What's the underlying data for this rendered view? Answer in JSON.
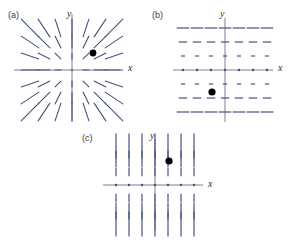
{
  "figure": {
    "width": 297,
    "height": 247,
    "background": "#ffffff",
    "colors": {
      "axis": "#6b6f86",
      "field": "#4a5080",
      "field_light": "#8d92ad",
      "marker": "#000000",
      "label": "#3a3a3a"
    }
  },
  "panels": [
    {
      "id": "a",
      "label": "(a)",
      "label_pos": {
        "x": 8,
        "y": 10
      },
      "origin": {
        "x": 72,
        "y": 70
      },
      "axis": {
        "x_min": -58,
        "x_max": 48,
        "y_min": -52,
        "y_max": 56,
        "x_label": "x",
        "y_label": "y",
        "x_label_pos": {
          "x": 128,
          "y": 62
        },
        "y_label_pos": {
          "x": 67,
          "y": 8
        }
      },
      "field": {
        "type": "radial",
        "description": "radial line segments pointing away from origin, length grows with radius",
        "grid_step": 14,
        "grid_half": 3,
        "segment_scale": 0.42,
        "segment_min": 1.5
      },
      "marker": {
        "x": 21,
        "y": 17,
        "r": 3.4,
        "color": "#000000"
      }
    },
    {
      "id": "b",
      "label": "(b)",
      "label_pos": {
        "x": 152,
        "y": 10
      },
      "origin": {
        "x": 225,
        "y": 70
      },
      "axis": {
        "x_min": -52,
        "x_max": 48,
        "y_min": -52,
        "y_max": 52,
        "x_label": "x",
        "y_label": "y",
        "x_label_pos": {
          "x": 278,
          "y": 62
        },
        "y_label_pos": {
          "x": 220,
          "y": 8
        }
      },
      "field": {
        "type": "horizontal-dashes",
        "description": "horizontal segments, length proportional to |y|, zero on the x-axis",
        "grid_step": 14,
        "grid_half": 3,
        "segment_scale": 0.3,
        "segment_min": 1.0
      },
      "marker": {
        "x": -13,
        "y": -22,
        "r": 3.6,
        "color": "#000000"
      }
    },
    {
      "id": "c",
      "label": "(c)",
      "label_pos": {
        "x": 82,
        "y": 133
      },
      "origin": {
        "x": 155,
        "y": 185
      },
      "axis": {
        "x_min": -52,
        "x_max": 48,
        "y_min": -46,
        "y_max": 46,
        "x_label": "x",
        "y_label": "y",
        "x_label_pos": {
          "x": 208,
          "y": 178
        },
        "y_label_pos": {
          "x": 150,
          "y": 130
        }
      },
      "field": {
        "type": "vertical-dashes",
        "description": "vertical segments, length proportional to |y|, zero on the x-axis",
        "grid_step": 13,
        "grid_half": 3,
        "segment_scale": 0.32,
        "segment_min": 1.0
      },
      "marker": {
        "x": 14,
        "y": 24,
        "r": 3.6,
        "color": "#000000"
      }
    }
  ]
}
